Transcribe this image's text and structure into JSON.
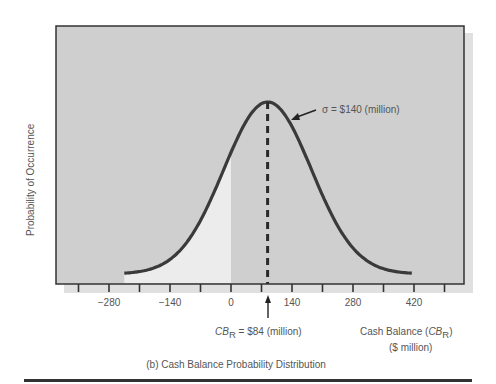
{
  "chart_data": {
    "type": "line",
    "title": "(b) Cash Balance Probability Distribution",
    "xlabel": "Cash Balance (CB_R) ($ million)",
    "xlabel_main": "Cash Balance (",
    "xlabel_var": "CB",
    "xlabel_sub": "R",
    "xlabel_close": ")",
    "xlabel_units": "($ million)",
    "ylabel": "Probability of Occurrence",
    "xlim": [
      -350,
      490
    ],
    "xticks": [
      -280,
      -140,
      0,
      140,
      280,
      420
    ],
    "xtick_labels": [
      "−280",
      "−140",
      "0",
      "140",
      "280",
      "420"
    ],
    "minor_tick_step": 70,
    "distribution": "normal",
    "mean": 84,
    "sigma": 140,
    "curve_range": [
      -245,
      415
    ],
    "shaded_region": {
      "from": -245,
      "to": 0,
      "meaning": "probability of negative cash balance"
    },
    "annotations": {
      "sigma_label": "σ = $140 (million)",
      "mean_label_var": "CB",
      "mean_label_sub": "R",
      "mean_label_rest": " = $84 (million)"
    },
    "grid": false,
    "legend": null
  },
  "colors": {
    "plot_bg": "#cfcfcf",
    "shadow": "#e2e2e2",
    "shaded_area": "#ececec",
    "curve": "#3a3a3a",
    "text": "#555555"
  }
}
